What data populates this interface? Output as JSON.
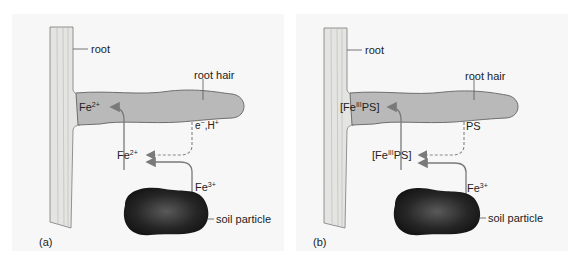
{
  "colors": {
    "background": "#f7f7f7",
    "root_fill": "#e4e4e2",
    "root_hair_fill": "#b9b9b9",
    "outline": "#6e6e6e",
    "arrow": "#7a7a7a",
    "soil_particle": "#2a2a2a"
  },
  "panels": [
    {
      "id": "a",
      "panel_label": "(a)",
      "root_label": "root",
      "root_hair_label": "root hair",
      "inside_species": {
        "base": "Fe",
        "sup": "2+",
        "prefix": "",
        "suffix": ""
      },
      "outside_species": {
        "base": "Fe",
        "sup": "2+",
        "prefix": "",
        "suffix": ""
      },
      "secreted": {
        "text": "e",
        "sup1": "−",
        "mid": ",H",
        "sup2": "+"
      },
      "soil_species": {
        "base": "Fe",
        "sup": "3+"
      },
      "soil_label": "soil particle"
    },
    {
      "id": "b",
      "panel_label": "(b)",
      "root_label": "root",
      "root_hair_label": "root hair",
      "inside_species": {
        "base": "[Fe",
        "sup": "III",
        "prefix": "",
        "suffix": "PS]"
      },
      "outside_species": {
        "base": "[Fe",
        "sup": "III",
        "prefix": "",
        "suffix": "PS]"
      },
      "secreted": {
        "text": "PS",
        "sup1": "",
        "mid": "",
        "sup2": ""
      },
      "soil_species": {
        "base": "Fe",
        "sup": "3+"
      },
      "soil_label": "soil particle"
    }
  ]
}
